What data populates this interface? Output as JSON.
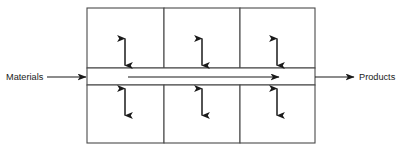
{
  "diagram": {
    "background_color": "#ffffff",
    "line_color": "#4a4a4a",
    "arrow_color": "#1a1a1a",
    "labels": {
      "input": "Materials",
      "output": "Products"
    },
    "geometry": {
      "box_left": 87,
      "box_right": 315,
      "box_top": 8,
      "box_bottom": 143,
      "channel_top": 68,
      "channel_bottom": 85,
      "dividers_x": [
        164,
        240
      ],
      "flow_y": 77,
      "flow_start_x": 128,
      "flow_end_x": 280,
      "input_arrow_start_x": 47,
      "input_arrow_end_x": 87,
      "output_arrow_start_x": 315,
      "output_arrow_end_x": 355,
      "exchange_centers_x": [
        125,
        202,
        277
      ],
      "upper_arrow_top_y": 37,
      "upper_arrow_bottom_y": 66,
      "lower_arrow_top_y": 87,
      "lower_arrow_bottom_y": 116
    },
    "cells": {
      "upper_row_count": 3,
      "lower_row_count": 3
    },
    "exchange_arrows": [
      {
        "id": "upper-1",
        "direction": "bidirectional-vertical"
      },
      {
        "id": "upper-2",
        "direction": "bidirectional-vertical"
      },
      {
        "id": "upper-3",
        "direction": "bidirectional-vertical"
      },
      {
        "id": "lower-1",
        "direction": "bidirectional-vertical"
      },
      {
        "id": "lower-2",
        "direction": "bidirectional-vertical"
      },
      {
        "id": "lower-3",
        "direction": "bidirectional-vertical"
      }
    ],
    "flow_arrows": [
      {
        "id": "input",
        "direction": "right"
      },
      {
        "id": "main-channel",
        "direction": "right"
      },
      {
        "id": "output",
        "direction": "right"
      }
    ]
  }
}
